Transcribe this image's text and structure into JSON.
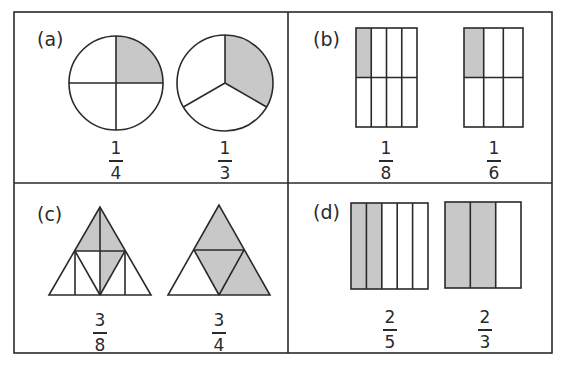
{
  "colors": {
    "stroke": "#2a2a2a",
    "shade": "#c8c8c8",
    "background": "#ffffff"
  },
  "panels": [
    {
      "id": "a",
      "label": "(a)",
      "shape": "circle",
      "figures": [
        {
          "shape": "circle",
          "parts": 4,
          "shaded": 1,
          "fraction": {
            "numerator": "1",
            "denominator": "4"
          }
        },
        {
          "shape": "circle",
          "parts": 3,
          "shaded": 1,
          "fraction": {
            "numerator": "1",
            "denominator": "3"
          }
        }
      ]
    },
    {
      "id": "b",
      "label": "(b)",
      "shape": "rectangle-grid",
      "figures": [
        {
          "shape": "rectangle",
          "parts": 8,
          "shaded": 1,
          "fraction": {
            "numerator": "1",
            "denominator": "8"
          }
        },
        {
          "shape": "rectangle",
          "parts": 6,
          "shaded": 1,
          "fraction": {
            "numerator": "1",
            "denominator": "6"
          }
        }
      ]
    },
    {
      "id": "c",
      "label": "(c)",
      "shape": "triangle",
      "figures": [
        {
          "shape": "triangle",
          "parts": 8,
          "shaded": 3,
          "fraction": {
            "numerator": "3",
            "denominator": "8"
          }
        },
        {
          "shape": "triangle",
          "parts": 4,
          "shaded": 3,
          "fraction": {
            "numerator": "3",
            "denominator": "4"
          }
        }
      ]
    },
    {
      "id": "d",
      "label": "(d)",
      "shape": "rectangle-strips",
      "figures": [
        {
          "shape": "rectangle",
          "parts": 5,
          "shaded": 2,
          "fraction": {
            "numerator": "2",
            "denominator": "5"
          }
        },
        {
          "shape": "rectangle",
          "parts": 3,
          "shaded": 2,
          "fraction": {
            "numerator": "2",
            "denominator": "3"
          }
        }
      ]
    }
  ]
}
